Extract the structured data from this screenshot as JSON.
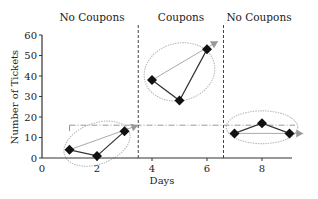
{
  "chart_data": {
    "type": "line",
    "title": "",
    "xlabel": "Days",
    "ylabel": "Number of Tickets",
    "xlim": [
      0,
      9.6
    ],
    "ylim": [
      0,
      60
    ],
    "xticks": [
      0,
      2,
      4,
      6,
      8
    ],
    "yticks": [
      0,
      10,
      20,
      30,
      40,
      50,
      60
    ],
    "grid": false,
    "regions": [
      {
        "label": "No Coupons",
        "x_start": 0,
        "x_end": 3.5
      },
      {
        "label": "Coupons",
        "x_start": 3.5,
        "x_end": 6.6
      },
      {
        "label": "No Coupons",
        "x_start": 6.6,
        "x_end": 9.6
      }
    ],
    "region_dividers": [
      3.5,
      6.6
    ],
    "series": [
      {
        "name": "Tickets",
        "x": [
          1,
          2,
          3,
          4,
          5,
          6,
          7,
          8,
          9
        ],
        "values": [
          4,
          1,
          13,
          38,
          28,
          53,
          12,
          17,
          12
        ],
        "marker": "diamond"
      }
    ],
    "trend_arrows": [
      {
        "from": [
          1,
          4
        ],
        "to": [
          3.5,
          16
        ]
      },
      {
        "from": [
          4,
          38
        ],
        "to": [
          6.4,
          57
        ]
      },
      {
        "from": [
          7,
          12
        ],
        "to": [
          9.5,
          12
        ]
      }
    ],
    "reference_line": {
      "y": 16,
      "x_start": 1,
      "x_end": 9.2,
      "style": "dash-dot"
    },
    "ellipses": [
      {
        "cx": 2,
        "cy": 7,
        "rx": 1.25,
        "ry": 10,
        "angle": -20
      },
      {
        "cx": 5,
        "cy": 42,
        "rx": 1.3,
        "ry": 14,
        "angle": -15
      },
      {
        "cx": 8,
        "cy": 15,
        "rx": 1.3,
        "ry": 8,
        "angle": 0
      }
    ]
  },
  "labels": {
    "region_1": "No Coupons",
    "region_2": "Coupons",
    "region_3": "No Coupons",
    "xlabel": "Days",
    "ylabel": "Number of Tickets"
  }
}
